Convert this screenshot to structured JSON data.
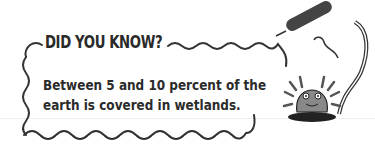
{
  "callout": {
    "title": "DID YOU KNOW?",
    "body_lines": [
      "Between 5 and 10 percent of the",
      "earth is covered in wetlands."
    ]
  },
  "illustration": {
    "icons": [
      "cattail-icon",
      "frog-on-lily-pad-icon"
    ]
  },
  "colors": {
    "ink": "#2a2a2a",
    "background": "#ffffff"
  }
}
